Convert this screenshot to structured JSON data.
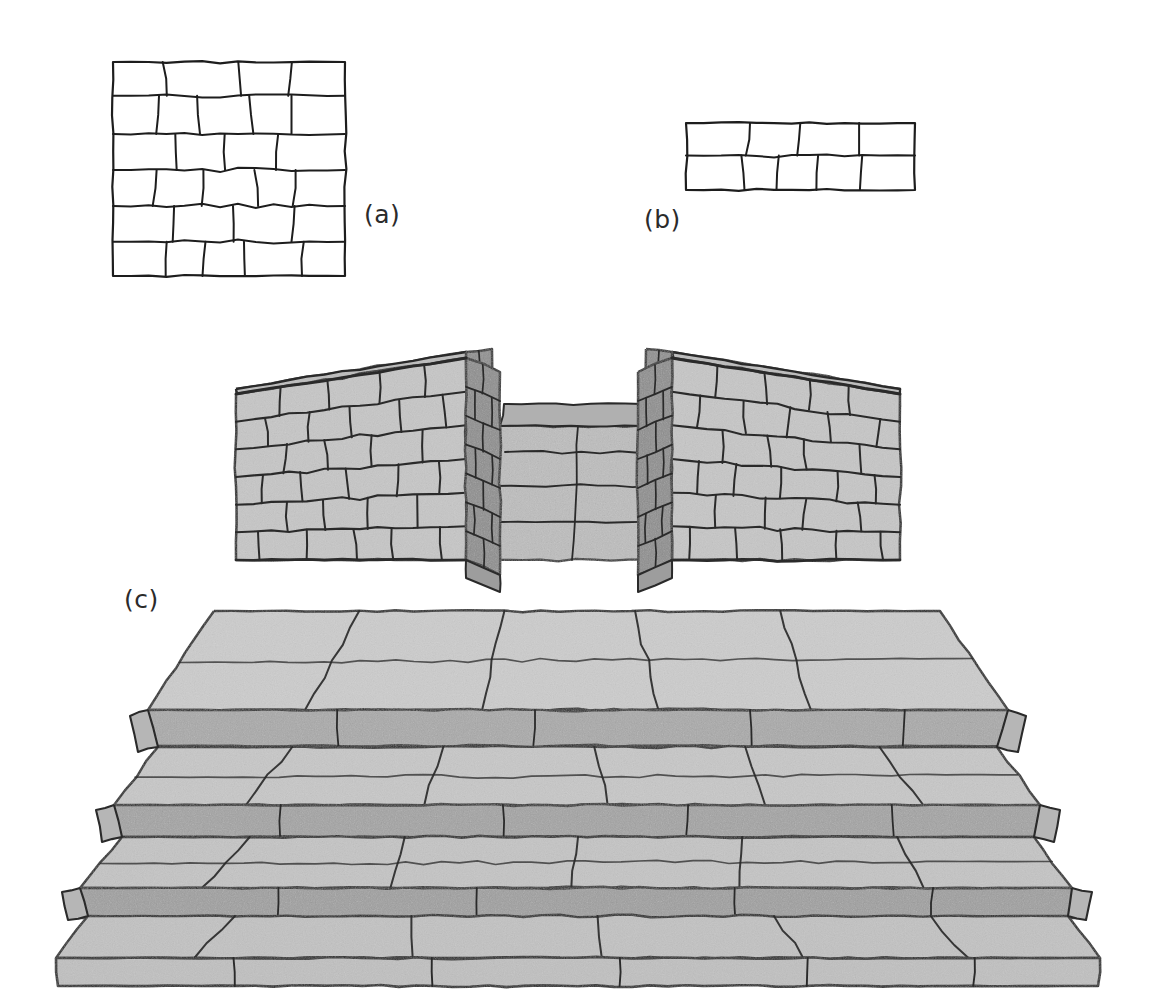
{
  "figure": {
    "background_color": "#ffffff",
    "ink_color": "#1d1d1d",
    "panels": [
      {
        "id": "a",
        "label": "(a)",
        "label_x": 364,
        "label_y": 200,
        "caption": "Irregular coursed ashlar wall elevation, square panel",
        "kind": "line-drawing",
        "box": {
          "x": 113,
          "y": 62,
          "width": 232,
          "height": 214
        },
        "courses": 6,
        "blocks_per_course": [
          4,
          5,
          4,
          5,
          4,
          5
        ],
        "fill": "#ffffff",
        "stroke": "#1d1d1d"
      },
      {
        "id": "b",
        "label": "(b)",
        "label_x": 644,
        "label_y": 205,
        "caption": "Two-course coursed rubble band elevation",
        "kind": "line-drawing",
        "box": {
          "x": 686,
          "y": 123,
          "width": 229,
          "height": 67
        },
        "courses": 2,
        "blocks_per_course": [
          4,
          5
        ],
        "fill": "#ffffff",
        "stroke": "#1d1d1d"
      },
      {
        "id": "c",
        "label": "(c)",
        "label_x": 124,
        "label_y": 585,
        "caption": "Axonometric view of a stepped stone platform with two flanking parapet walls and a central stair opening",
        "kind": "shaded-axonometric",
        "steps": 4,
        "walls": 2,
        "face_fill": "#c9c9c9",
        "top_fill": "#cfcfcf",
        "riser_fill": "#a8a8a8",
        "side_fill": "#9a9a9a",
        "inner_fill": "#b4b4b4",
        "stroke": "#2a2a2a"
      }
    ],
    "labels": {
      "a": "(a)",
      "b": "(b)",
      "c": "(c)"
    }
  }
}
